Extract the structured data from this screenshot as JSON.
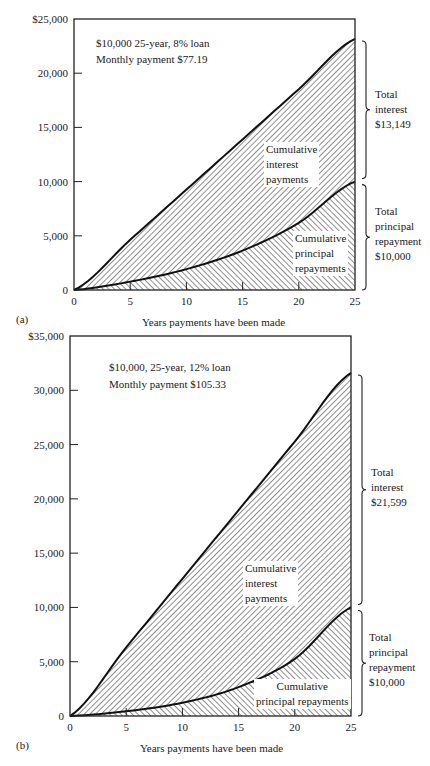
{
  "chart_data": [
    {
      "id": "a",
      "type": "area",
      "panel_label": "(a)",
      "title": "",
      "annotation": [
        "$10,000 25-year, 8% loan",
        "Monthly payment $77.19"
      ],
      "xlabel": "Years payments have been made",
      "ylabel": "",
      "x": [
        0,
        5,
        10,
        15,
        20,
        25
      ],
      "xticks": [
        "0",
        "5",
        "10",
        "15",
        "20",
        "25"
      ],
      "yticks": [
        "0",
        "5,000",
        "10,000",
        "15,000",
        "20,000",
        "$25,000"
      ],
      "ylim": [
        0,
        25000
      ],
      "series": [
        {
          "name": "Cumulative total payments (interest + principal)",
          "values": [
            0,
            4631,
            9263,
            13894,
            18526,
            23157
          ]
        },
        {
          "name": "Cumulative principal repayments",
          "values": [
            0,
            772,
            1923,
            3636,
            6192,
            10000
          ]
        }
      ],
      "area_labels": {
        "interest": [
          "Cumulative",
          "interest",
          "payments"
        ],
        "principal": [
          "Cumulative",
          "principal",
          "repayments"
        ]
      },
      "brace_labels": {
        "interest": [
          "Total",
          "interest",
          "$13,149"
        ],
        "principal": [
          "Total",
          "principal",
          "repayment",
          "$10,000"
        ]
      },
      "grid": false,
      "legend": "none"
    },
    {
      "id": "b",
      "type": "area",
      "panel_label": "(b)",
      "title": "",
      "annotation": [
        "$10,000, 25-year, 12% loan",
        "Monthly payment $105.33"
      ],
      "xlabel": "Years payments have been made",
      "ylabel": "",
      "x": [
        0,
        5,
        10,
        15,
        20,
        25
      ],
      "xticks": [
        "0",
        "5",
        "10",
        "15",
        "20",
        "25"
      ],
      "yticks": [
        "0",
        "5,000",
        "10,000",
        "15,000",
        "20,000",
        "25,000",
        "30,000",
        "$35,000"
      ],
      "ylim": [
        0,
        35000
      ],
      "series": [
        {
          "name": "Cumulative total payments (interest + principal)",
          "values": [
            0,
            6320,
            12640,
            18960,
            25280,
            31599
          ]
        },
        {
          "name": "Cumulative principal repayments",
          "values": [
            0,
            434,
            1224,
            2658,
            5263,
            10000
          ]
        }
      ],
      "area_labels": {
        "interest": [
          "Cumulative",
          "interest",
          "payments"
        ],
        "principal": [
          "Cumulative",
          "principal repayments"
        ]
      },
      "brace_labels": {
        "interest": [
          "Total",
          "interest",
          "$21,599"
        ],
        "principal": [
          "Total",
          "principal",
          "repayment",
          "$10,000"
        ]
      },
      "grid": false,
      "legend": "none"
    }
  ]
}
